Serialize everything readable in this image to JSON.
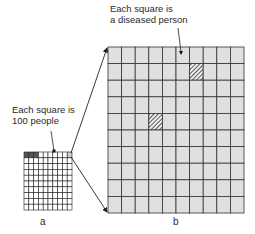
{
  "diagram": {
    "label_b": {
      "line1": "Each square is",
      "line2": "a diseased person"
    },
    "label_a": {
      "line1": "Each square is",
      "line2": "100 people"
    },
    "caption_a": "a",
    "caption_b": "b",
    "small_grid": {
      "rows": 10,
      "cols": 10,
      "dark_cells": [
        [
          0,
          0
        ],
        [
          0,
          1
        ],
        [
          0,
          2
        ]
      ],
      "highlight_cell": [
        0,
        9
      ],
      "cell_color": "#ffffff",
      "dark_color": "#555555",
      "highlight_color": "#cccccc"
    },
    "large_grid": {
      "rows": 10,
      "cols": 10,
      "hatched_cells": [
        [
          1,
          6
        ],
        [
          4,
          3
        ]
      ],
      "cell_color": "#e0e0e0",
      "line_color": "#333333"
    }
  }
}
